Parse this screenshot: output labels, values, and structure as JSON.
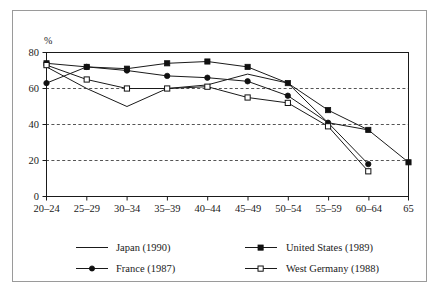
{
  "chart_data": {
    "type": "line",
    "title": "",
    "subtitle": "",
    "xlabel": "",
    "ylabel": "%",
    "ylim": [
      0,
      80
    ],
    "yticks": [
      0,
      20,
      40,
      60,
      80
    ],
    "ytick_labels": [
      "0",
      "20",
      "40",
      "60",
      "80"
    ],
    "gridlines": [
      20,
      40,
      60
    ],
    "grid": "horizontal-dashed",
    "legend_position": "bottom",
    "categories": [
      "20–24",
      "25–29",
      "30–34",
      "35–39",
      "40–44",
      "45–49",
      "50–54",
      "55–59",
      "60–64",
      "65"
    ],
    "series": [
      {
        "name": "Japan (1990)",
        "marker": "none",
        "values": [
          72,
          60,
          50,
          60,
          62,
          68,
          63,
          41,
          37,
          null
        ]
      },
      {
        "name": "France (1987)",
        "marker": "filled-circle",
        "values": [
          63,
          72,
          70,
          67,
          66,
          64,
          56,
          41,
          18,
          null
        ]
      },
      {
        "name": "United States (1989)",
        "marker": "filled-square",
        "values": [
          74,
          72,
          71,
          74,
          75,
          72,
          63,
          48,
          37,
          19
        ]
      },
      {
        "name": "West Germany (1988)",
        "marker": "open-square",
        "values": [
          73,
          65,
          60,
          60,
          61,
          55,
          52,
          39,
          14,
          null
        ]
      }
    ]
  },
  "axis": {
    "y_unit_label": "%",
    "y_tick_labels": [
      "80",
      "60",
      "40",
      "20",
      "0"
    ],
    "x_tick_labels": [
      "20–24",
      "25–29",
      "30–34",
      "35–39",
      "40–44",
      "45–49",
      "50–54",
      "55–59",
      "60–64",
      "65"
    ]
  },
  "legend": {
    "entries": [
      {
        "label": "Japan (1990)",
        "marker": "none"
      },
      {
        "label": "France (1987)",
        "marker": "filled-circle"
      },
      {
        "label": "United States (1989)",
        "marker": "filled-square"
      },
      {
        "label": "West Germany (1988)",
        "marker": "open-square"
      }
    ]
  },
  "colors": {
    "line": "#1a1a1a",
    "grid": "#555555",
    "frame": "#9a9a9a",
    "background": "#ffffff"
  }
}
